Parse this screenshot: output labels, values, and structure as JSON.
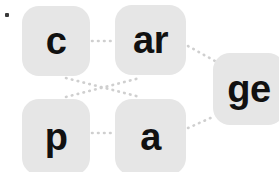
{
  "canvas": {
    "width": 279,
    "height": 172,
    "background_color": "#ffffff"
  },
  "style": {
    "tile_fill": "#e6e6e6",
    "tile_text_color": "#111111",
    "edge_color": "#cfcfcf",
    "marker_color": "#3a3a3a"
  },
  "marker": {
    "name": "corner-dot",
    "x": 5,
    "y": 13
  },
  "tiles": [
    {
      "id": "c",
      "label": "c",
      "x": 22,
      "y": 6,
      "width": 68,
      "height": 70,
      "font_size": 38
    },
    {
      "id": "ar",
      "label": "ar",
      "x": 115,
      "y": 5,
      "width": 71,
      "height": 70,
      "font_size": 38
    },
    {
      "id": "ge",
      "label": "ge",
      "x": 213,
      "y": 53,
      "width": 72,
      "height": 72,
      "font_size": 38
    },
    {
      "id": "p",
      "label": "p",
      "x": 22,
      "y": 99,
      "width": 68,
      "height": 76,
      "font_size": 38
    },
    {
      "id": "a",
      "label": "a",
      "x": 115,
      "y": 99,
      "width": 71,
      "height": 76,
      "font_size": 38
    }
  ],
  "edges": [
    {
      "id": "c-ar",
      "from": "c",
      "to": "ar",
      "x1": 92,
      "y1": 41,
      "x2": 113,
      "y2": 41
    },
    {
      "id": "c-a",
      "from": "c",
      "to": "a",
      "x1": 66,
      "y1": 78,
      "x2": 140,
      "y2": 97
    },
    {
      "id": "p-ar",
      "from": "p",
      "to": "ar",
      "x1": 66,
      "y1": 97,
      "x2": 140,
      "y2": 78
    },
    {
      "id": "p-a",
      "from": "p",
      "to": "a",
      "x1": 92,
      "y1": 133,
      "x2": 113,
      "y2": 133
    },
    {
      "id": "ar-ge",
      "from": "ar",
      "to": "ge",
      "x1": 188,
      "y1": 46,
      "x2": 215,
      "y2": 61
    },
    {
      "id": "a-ge",
      "from": "a",
      "to": "ge",
      "x1": 188,
      "y1": 128,
      "x2": 215,
      "y2": 116
    }
  ]
}
